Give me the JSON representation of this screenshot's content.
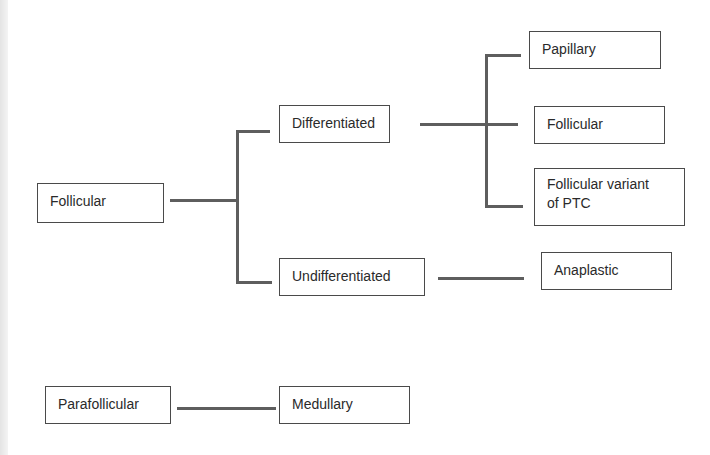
{
  "diagram": {
    "type": "classification-tree",
    "nodes": {
      "follicular": "Follicular",
      "differentiated": "Differentiated",
      "undifferentiated": "Undifferentiated",
      "papillary": "Papillary",
      "follicular_sub": "Follicular",
      "follicular_variant_line1": "Follicular variant",
      "follicular_variant_line2": "of PTC",
      "anaplastic": "Anaplastic",
      "parafollicular": "Parafollicular",
      "medullary": "Medullary"
    },
    "edges": [
      [
        "Follicular",
        "Differentiated"
      ],
      [
        "Follicular",
        "Undifferentiated"
      ],
      [
        "Differentiated",
        "Papillary"
      ],
      [
        "Differentiated",
        "Follicular"
      ],
      [
        "Differentiated",
        "Follicular variant of PTC"
      ],
      [
        "Undifferentiated",
        "Anaplastic"
      ],
      [
        "Parafollicular",
        "Medullary"
      ]
    ]
  }
}
